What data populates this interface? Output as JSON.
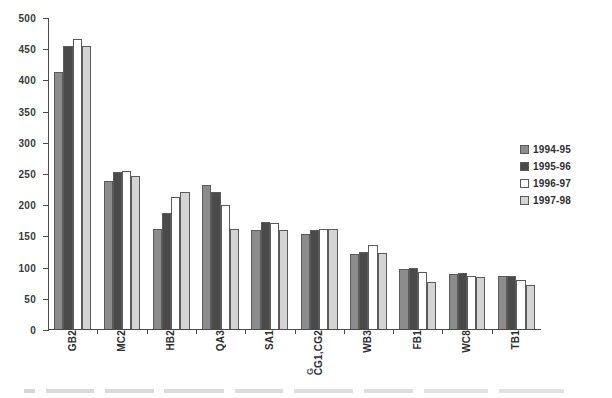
{
  "chart_data": {
    "type": "bar",
    "title": "",
    "subtitle": "",
    "xlabel": "",
    "ylabel": "",
    "ylim": [
      0,
      500
    ],
    "ytick_step": 50,
    "yticks": [
      0,
      50,
      100,
      150,
      200,
      250,
      300,
      350,
      400,
      450,
      500
    ],
    "ytick_labels": [
      "0",
      "50",
      "100",
      "150",
      "200",
      "250",
      "300",
      "350",
      "400",
      "450",
      "500"
    ],
    "grid": false,
    "legend_position": "right",
    "categories": [
      "GB2",
      "MC2",
      "HB2",
      "QA3",
      "SA1",
      "CG1,CG2",
      "WB3",
      "FB1",
      "WC8",
      "TB1"
    ],
    "series": [
      {
        "name": "1994-95",
        "color": "#8c8c8c",
        "values": [
          412,
          238,
          161,
          230,
          159,
          152,
          120,
          96,
          88,
          85
        ]
      },
      {
        "name": "1995-96",
        "color": "#4a4a4a",
        "values": [
          453,
          252,
          186,
          220,
          171,
          159,
          123,
          98,
          90,
          85
        ]
      },
      {
        "name": "1996-97",
        "color": "#ffffff",
        "values": [
          465,
          254,
          212,
          199,
          170,
          161,
          134,
          91,
          85,
          78
        ]
      },
      {
        "name": "1997-98",
        "color": "#d4d4d4",
        "values": [
          453,
          245,
          219,
          161,
          159,
          160,
          122,
          76,
          83,
          70
        ]
      }
    ]
  },
  "legend": {
    "entries": [
      {
        "label": "1994-95",
        "color": "#8c8c8c"
      },
      {
        "label": "1995-96",
        "color": "#4a4a4a"
      },
      {
        "label": "1996-97",
        "color": "#ffffff"
      },
      {
        "label": "1997-98",
        "color": "#d4d4d4"
      }
    ]
  },
  "axis_colors": {
    "axis_line": "#4a4a4a",
    "tick_label": "#3a3a3a",
    "bar_outline": "#5b5b5b",
    "background": "#ffffff"
  }
}
